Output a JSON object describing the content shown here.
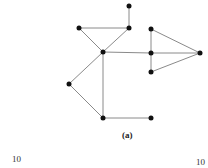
{
  "figure": {
    "caption": "(a)",
    "nodes": [
      {
        "id": "n1",
        "x": 129,
        "y": 6
      },
      {
        "id": "n2",
        "x": 79,
        "y": 28
      },
      {
        "id": "n3",
        "x": 129,
        "y": 28
      },
      {
        "id": "n4",
        "x": 103,
        "y": 52
      },
      {
        "id": "n5",
        "x": 151,
        "y": 29
      },
      {
        "id": "n6",
        "x": 151,
        "y": 53
      },
      {
        "id": "n7",
        "x": 151,
        "y": 72
      },
      {
        "id": "n8",
        "x": 200,
        "y": 53
      },
      {
        "id": "n9",
        "x": 69,
        "y": 84
      },
      {
        "id": "n10",
        "x": 103,
        "y": 118
      },
      {
        "id": "n11",
        "x": 151,
        "y": 118
      }
    ],
    "edges": [
      [
        "n1",
        "n3"
      ],
      [
        "n2",
        "n3"
      ],
      [
        "n2",
        "n4"
      ],
      [
        "n3",
        "n4"
      ],
      [
        "n4",
        "n6"
      ],
      [
        "n5",
        "n6"
      ],
      [
        "n6",
        "n7"
      ],
      [
        "n5",
        "n8"
      ],
      [
        "n6",
        "n8"
      ],
      [
        "n7",
        "n8"
      ],
      [
        "n4",
        "n9"
      ],
      [
        "n4",
        "n10"
      ],
      [
        "n9",
        "n10"
      ],
      [
        "n10",
        "n11"
      ]
    ]
  },
  "page_numbers": {
    "left": "10",
    "right": "10"
  }
}
